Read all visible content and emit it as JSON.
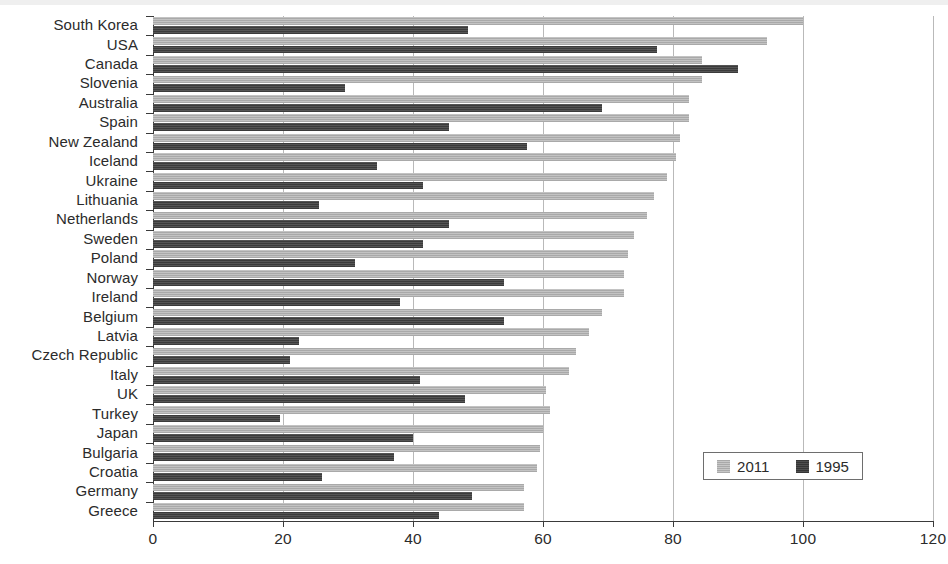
{
  "chart_data": {
    "type": "bar",
    "orientation": "horizontal",
    "title": "",
    "subtitle": "",
    "xlabel": "",
    "ylabel": "",
    "xlim": [
      0,
      120
    ],
    "xticks": [
      0,
      20,
      40,
      60,
      80,
      100,
      120
    ],
    "xtick_labels": [
      "0",
      "20",
      "40",
      "60",
      "80",
      "100",
      "120"
    ],
    "grid": true,
    "grid_axis": "x",
    "legend": {
      "position": "bottom-right",
      "entries": [
        {
          "name": "2011",
          "color": "#b2b2b2"
        },
        {
          "name": "1995",
          "color": "#424242"
        }
      ]
    },
    "categories": [
      "South Korea",
      "USA",
      "Canada",
      "Slovenia",
      "Australia",
      "Spain",
      "New Zealand",
      "Iceland",
      "Ukraine",
      "Lithuania",
      "Netherlands",
      "Sweden",
      "Poland",
      "Norway",
      "Ireland",
      "Belgium",
      "Latvia",
      "Czech Republic",
      "Italy",
      "UK",
      "Turkey",
      "Japan",
      "Bulgaria",
      "Croatia",
      "Germany",
      "Greece"
    ],
    "series": [
      {
        "name": "2011",
        "color": "#b2b2b2",
        "values": [
          100,
          94.5,
          84.5,
          84.5,
          82.5,
          82.5,
          81,
          80.5,
          79,
          77,
          76,
          74,
          73,
          72.5,
          72.5,
          69,
          67,
          65,
          64,
          60.5,
          61,
          60,
          59.5,
          59,
          57,
          57
        ]
      },
      {
        "name": "1995",
        "color": "#424242",
        "values": [
          48.5,
          77.5,
          90,
          29.5,
          69,
          45.5,
          57.5,
          34.5,
          41.5,
          25.5,
          45.5,
          41.5,
          31,
          54,
          38,
          54,
          22.5,
          21,
          41,
          48,
          19.5,
          40,
          37,
          26,
          49,
          44
        ]
      }
    ]
  },
  "axis": {
    "tick_labels": [
      "0",
      "20",
      "40",
      "60",
      "80",
      "100",
      "120"
    ]
  }
}
